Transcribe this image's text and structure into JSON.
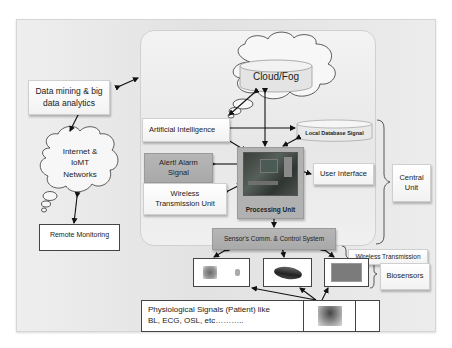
{
  "diagram": {
    "nodes": {
      "cloud_fog": "Cloud/Fog",
      "artificial_intelligence": "Artificial Intelligence",
      "local_database": "Local Database Signal",
      "alert_alarm": "Alert! Alarm Signal",
      "wireless_unit": "Wireless Transmission Unit",
      "processing_unit": "Processing Unit",
      "user_interface": "User Interface",
      "central_unit": "Central Unit",
      "sensors_comm": "Sensor's Comm. & Control System",
      "wireless_transmission": "Wireless Transmission",
      "biosensors": "Biosensors",
      "physiological_signals_line1": "Physiological Signals (Patient) like",
      "physiological_signals_line2": "BL, ECG, OSL, etc………..",
      "data_mining_line1": "Data mining & big",
      "data_mining_line2": "data analytics",
      "internet_line1": "Internet &",
      "internet_line2": "IoMT",
      "internet_line3": "Networks",
      "remote_monitoring": "Remote Monitoring"
    },
    "images": {
      "processing_board": "circuit-board-image",
      "sensor_1": "wearable-sensor-image",
      "sensor_2": "wristband-sensor-image",
      "sensor_3": "patch-sensor-image",
      "patient": "patient-image"
    },
    "edges": [
      {
        "from": "data_mining",
        "to": "inner_panel",
        "type": "bidirectional"
      },
      {
        "from": "data_mining",
        "to": "internet",
        "type": "bidirectional"
      },
      {
        "from": "internet",
        "to": "remote_monitoring",
        "type": "bidirectional"
      },
      {
        "from": "cloud_fog",
        "to": "artificial_intelligence",
        "type": "bidirectional"
      },
      {
        "from": "cloud_fog",
        "to": "processing_unit",
        "type": "bidirectional"
      },
      {
        "from": "artificial_intelligence",
        "to": "local_database",
        "type": "bidirectional"
      },
      {
        "from": "artificial_intelligence",
        "to": "processing_unit",
        "type": "bidirectional"
      },
      {
        "from": "local_database",
        "to": "processing_unit",
        "type": "bidirectional"
      },
      {
        "from": "alert_alarm",
        "to": "processing_unit",
        "type": "bidirectional"
      },
      {
        "from": "wireless_unit",
        "to": "processing_unit",
        "type": "bidirectional"
      },
      {
        "from": "user_interface",
        "to": "processing_unit",
        "type": "bidirectional"
      },
      {
        "from": "processing_unit",
        "to": "sensors_comm",
        "type": "bidirectional"
      },
      {
        "from": "sensors_comm",
        "to": "sensor_1",
        "type": "bidirectional"
      },
      {
        "from": "sensors_comm",
        "to": "sensor_2",
        "type": "bidirectional"
      },
      {
        "from": "sensors_comm",
        "to": "sensor_3",
        "type": "bidirectional"
      },
      {
        "from": "patient",
        "to": "sensor_1",
        "type": "directed"
      },
      {
        "from": "patient",
        "to": "sensor_2",
        "type": "directed"
      },
      {
        "from": "patient",
        "to": "sensor_3",
        "type": "directed"
      }
    ],
    "colors": {
      "outer_panel": "#e6e6e6",
      "box_fill": "#ffffff",
      "dark_box": "#aeaeae",
      "line": "#222222"
    }
  }
}
